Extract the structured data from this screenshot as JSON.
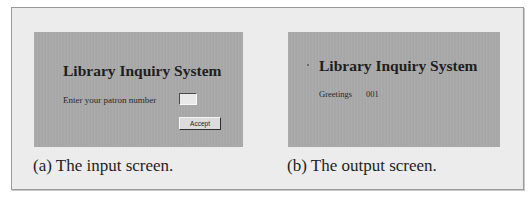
{
  "figure": {
    "panels": [
      {
        "id": "a",
        "screen": {
          "title": "Library Inquiry System",
          "prompt_label": "Enter your patron number",
          "patron_input_value": "",
          "accept_button_label": "Accept"
        },
        "caption": "(a) The input screen."
      },
      {
        "id": "b",
        "screen": {
          "title": "Library Inquiry System",
          "greeting_label": "Greetings",
          "greeting_value": "001"
        },
        "caption": "(b) The output screen."
      }
    ],
    "colors": {
      "screen_background": "#a9a9a9",
      "figure_background": "#ececec",
      "text": "#1e1e1e"
    }
  }
}
